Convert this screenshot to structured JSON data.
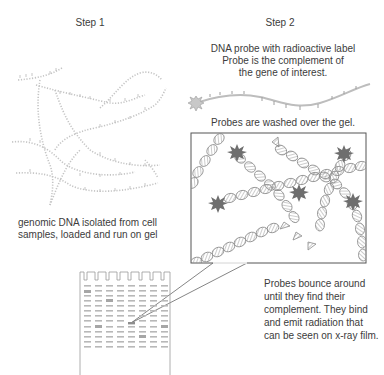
{
  "step1": {
    "title": "Step 1",
    "caption_lines": [
      "genomic DNA isolated from cell",
      "samples, loaded and run on gel"
    ]
  },
  "step2": {
    "title": "Step 2",
    "probe_caption_lines": [
      "DNA probe with radioactive label",
      "Probe is the complement of",
      "the gene of interest."
    ],
    "wash_caption": "Probes are washed over the gel.",
    "bounce_caption_lines": [
      "Probes bounce around",
      "until they find their",
      "complement. They bind",
      "and emit radiation that",
      "can be seen on x-ray film."
    ]
  },
  "icons": {
    "dna_strand": "dna-strand-icon",
    "radioactive_label": "starburst-icon",
    "double_helix": "double-helix-icon",
    "gel": "electrophoresis-gel-icon"
  },
  "colors": {
    "text": "#3c3c3c",
    "strand": "#bdbdbd",
    "helix": "#a8a8a8",
    "star": "#777777",
    "box_border": "#555555",
    "gel_band": "#b0b0b0"
  },
  "gel": {
    "lanes": 8,
    "rows": 13
  }
}
